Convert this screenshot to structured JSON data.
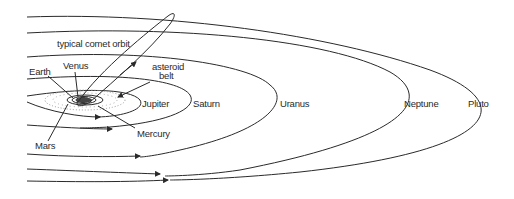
{
  "diagram": {
    "type": "solar-system-orbits",
    "labels": {
      "comet": "typical comet orbit",
      "earth": "Earth",
      "venus": "Venus",
      "asteroid_line1": "asteroid",
      "asteroid_line2": "belt",
      "jupiter": "Jupiter",
      "saturn": "Saturn",
      "uranus": "Uranus",
      "neptune": "Neptune",
      "pluto": "Pluto",
      "mercury": "Mercury",
      "mars": "Mars"
    },
    "orbits": [
      "Mercury",
      "Venus",
      "Earth",
      "Mars",
      "Jupiter",
      "Saturn",
      "Uranus",
      "Neptune",
      "Pluto",
      "comet"
    ],
    "colors": {
      "line": "#2a2a2a",
      "background": "#ffffff"
    }
  }
}
